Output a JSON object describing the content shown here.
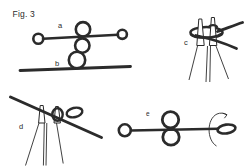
{
  "figure_label": "Fig. 3",
  "subfigures": [
    {
      "id": "a",
      "label": "a"
    },
    {
      "id": "b",
      "label": "b"
    },
    {
      "id": "c",
      "label": "c"
    },
    {
      "id": "d",
      "label": "d"
    },
    {
      "id": "e",
      "label": "e"
    }
  ],
  "icons": {
    "rotation_arrow_icon": "↻"
  },
  "colors": {
    "ink": "#2b2b2b",
    "background": "#ffffff"
  }
}
